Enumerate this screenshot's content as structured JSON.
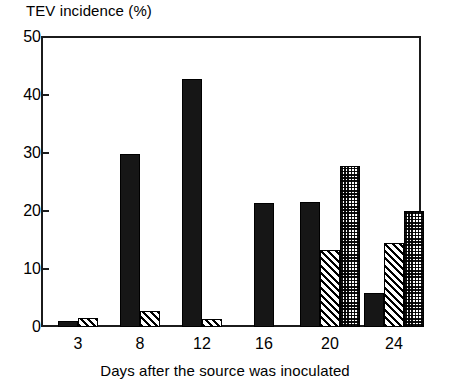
{
  "chart_data": {
    "type": "bar",
    "title": "",
    "ylabel": "TEV incidence (%)",
    "xlabel": "Days after the source was inoculated",
    "categories": [
      "3",
      "8",
      "12",
      "16",
      "20",
      "24"
    ],
    "ylim": [
      0,
      50
    ],
    "yticks": [
      0,
      10,
      20,
      30,
      40,
      50
    ],
    "ytick_labels": [
      "0",
      "10",
      "20",
      "30",
      "40",
      "50"
    ],
    "grid": false,
    "legend": "none",
    "series": [
      {
        "name": "black",
        "fill": "solid-black",
        "color": "#161616",
        "values": [
          1.0,
          29.8,
          42.8,
          21.3,
          21.5,
          5.8
        ]
      },
      {
        "name": "hatched",
        "fill": "diagonal-hatch",
        "color": "#ffffff",
        "values": [
          1.5,
          2.8,
          1.3,
          0,
          13.2,
          14.5
        ]
      },
      {
        "name": "stippled",
        "fill": "stipple",
        "color": "#ffffff",
        "values": [
          0,
          0,
          0,
          0,
          27.8,
          20.0
        ]
      }
    ]
  },
  "axes": {
    "y_title": "TEV incidence (%)",
    "x_title": "Days after the source was inoculated",
    "y_ticks": [
      "50",
      "40",
      "30",
      "20",
      "10",
      "0"
    ],
    "x_ticks": [
      "3",
      "8",
      "12",
      "16",
      "20",
      "24"
    ]
  },
  "colors": {
    "axis": "#1b1b1b",
    "bar_solid": "#161616",
    "bar_outline": "#000000",
    "background": "#ffffff"
  }
}
